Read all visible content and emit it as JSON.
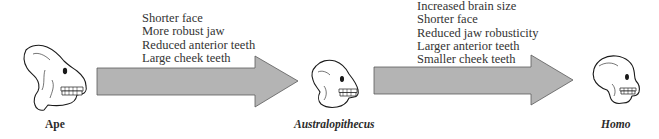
{
  "diagram": {
    "stages": [
      {
        "id": "ape",
        "label": "Ape",
        "italic": false,
        "icon": "ape-skull-icon"
      },
      {
        "id": "australopithecus",
        "label": "Australopithecus",
        "italic": true,
        "icon": "australopithecus-skull-icon"
      },
      {
        "id": "homo",
        "label": "Homo",
        "italic": true,
        "icon": "homo-skull-icon"
      }
    ],
    "transitions": [
      {
        "from": "Ape",
        "to": "Australopithecus",
        "traits": [
          "Shorter face",
          "More robust jaw",
          "Reduced anterior teeth",
          "Large cheek teeth"
        ]
      },
      {
        "from": "Australopithecus",
        "to": "Homo",
        "traits": [
          "Increased brain size",
          "Shorter face",
          "Reduced jaw robusticity",
          "Larger anterior teeth",
          "Smaller cheek teeth"
        ]
      }
    ],
    "colors": {
      "arrow_fill": "#b4b4b4",
      "arrow_stroke": "#555555",
      "skull_stroke": "#1a1a1a",
      "text": "#333333"
    }
  }
}
